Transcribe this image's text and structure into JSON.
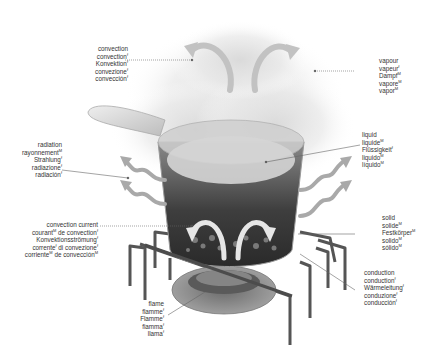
{
  "diagram": {
    "labels": {
      "convection": {
        "lines": [
          {
            "text": "convection",
            "gender": ""
          },
          {
            "text": "convection",
            "gender": "f"
          },
          {
            "text": "Konvektion",
            "gender": "f"
          },
          {
            "text": "convezione",
            "gender": "f"
          },
          {
            "text": "convección",
            "gender": "f"
          }
        ]
      },
      "vapour": {
        "lines": [
          {
            "text": "vapour",
            "gender": ""
          },
          {
            "text": "vapeur",
            "gender": "f"
          },
          {
            "text": "Dampf",
            "gender": "M"
          },
          {
            "text": "vapore",
            "gender": "M"
          },
          {
            "text": "vapor",
            "gender": "M"
          }
        ]
      },
      "radiation": {
        "lines": [
          {
            "text": "radiation",
            "gender": ""
          },
          {
            "text": "rayonnement",
            "gender": "M"
          },
          {
            "text": "Strahlung",
            "gender": "f"
          },
          {
            "text": "radiazione",
            "gender": "f"
          },
          {
            "text": "radiación",
            "gender": "f"
          }
        ]
      },
      "liquid": {
        "lines": [
          {
            "text": "liquid",
            "gender": ""
          },
          {
            "text": "liquide",
            "gender": "M"
          },
          {
            "text": "Flüssigkeit",
            "gender": "f"
          },
          {
            "text": "liquido",
            "gender": "M"
          },
          {
            "text": "líquido",
            "gender": "M"
          }
        ]
      },
      "convection_current": {
        "lines": [
          {
            "text": "convection current",
            "gender": ""
          },
          {
            "text": "courant",
            "gender": "M",
            "suffix": " de convection",
            "suffix_gender": "f"
          },
          {
            "text": "Konvektionsströmung",
            "gender": "f"
          },
          {
            "text": "corrente",
            "gender": "f",
            "suffix": " di convezione",
            "suffix_gender": "f"
          },
          {
            "text": "corriente",
            "gender": "M",
            "suffix": " de convección",
            "suffix_gender": "M"
          }
        ]
      },
      "solid": {
        "lines": [
          {
            "text": "solid",
            "gender": ""
          },
          {
            "text": "solide",
            "gender": "M"
          },
          {
            "text": "Festkörper",
            "gender": "M"
          },
          {
            "text": "solido",
            "gender": "M"
          },
          {
            "text": "sólido",
            "gender": "M"
          }
        ]
      },
      "conduction": {
        "lines": [
          {
            "text": "conduction",
            "gender": ""
          },
          {
            "text": "conduction",
            "gender": "f"
          },
          {
            "text": "Wärmeleitung",
            "gender": "f"
          },
          {
            "text": "conduzione",
            "gender": "f"
          },
          {
            "text": "conducción",
            "gender": "f"
          }
        ]
      },
      "flame": {
        "lines": [
          {
            "text": "flame",
            "gender": ""
          },
          {
            "text": "flamme",
            "gender": "f"
          },
          {
            "text": "Flamme",
            "gender": "f"
          },
          {
            "text": "fiamma",
            "gender": "f"
          },
          {
            "text": "llama",
            "gender": "f"
          }
        ]
      }
    },
    "colors": {
      "text": "#333333",
      "leader": "#555555",
      "arrow": "#a9a9a9",
      "pot_dark": "#3a3a3a",
      "steam": "#e4e4e4",
      "grate": "#5a5a5a"
    }
  }
}
